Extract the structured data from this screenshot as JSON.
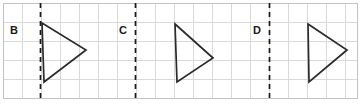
{
  "figure": {
    "canvas": {
      "width": 360,
      "height": 108
    },
    "background_color": "#ffffff",
    "grid": {
      "visible": true,
      "cell_size": 19,
      "origin_x": 3,
      "origin_y": 3,
      "columns": 18,
      "rows": 5,
      "line_color": "#d9d9d9",
      "frame_color": "#c2c2c2",
      "x_positions": [
        3,
        22,
        41,
        60,
        79,
        98,
        117,
        136,
        155,
        174,
        193,
        212,
        231,
        250,
        269,
        288,
        307,
        326,
        345,
        357
      ],
      "y_positions": [
        3,
        22,
        41,
        60,
        79,
        98
      ]
    },
    "mirror_lines": [
      {
        "label": "B",
        "x": 40,
        "y_top": 3,
        "y_bottom": 99,
        "style": "dashed",
        "color": "#1a1a1a",
        "label_x": 14,
        "label_y": 31
      },
      {
        "label": "C",
        "x": 135,
        "y_top": 3,
        "y_bottom": 99,
        "style": "dashed",
        "color": "#1a1a1a",
        "label_x": 123,
        "label_y": 31
      },
      {
        "label": "D",
        "x": 269,
        "y_top": 3,
        "y_bottom": 99,
        "style": "dashed",
        "color": "#1a1a1a",
        "label_x": 257,
        "label_y": 31
      }
    ],
    "triangles": [
      {
        "name": "triangle-b",
        "points": "42,23 86,50 44,82",
        "vertices": [
          {
            "x": 42,
            "y": 23
          },
          {
            "x": 86,
            "y": 50
          },
          {
            "x": 44,
            "y": 82
          }
        ],
        "stroke_color": "#2b2b2b"
      },
      {
        "name": "triangle-c",
        "points": "175,24 213,58 177,82",
        "vertices": [
          {
            "x": 175,
            "y": 24
          },
          {
            "x": 213,
            "y": 58
          },
          {
            "x": 177,
            "y": 82
          }
        ],
        "stroke_color": "#2b2b2b"
      },
      {
        "name": "triangle-d",
        "points": "308,24 347,50 309,82",
        "vertices": [
          {
            "x": 308,
            "y": 24
          },
          {
            "x": 347,
            "y": 50
          },
          {
            "x": 309,
            "y": 82
          }
        ],
        "stroke_color": "#2b2b2b"
      }
    ]
  }
}
